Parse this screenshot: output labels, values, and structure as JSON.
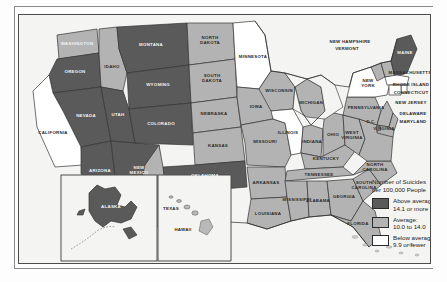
{
  "map": {
    "title": "Number of Suicides per 100,000 People",
    "projection": "united-states-choropleth",
    "colors": {
      "above_average": "#5a5a5a",
      "average": "#b3b3b3",
      "below_average": "#ffffff",
      "ocean": "#f4f4f2",
      "border": "#333333"
    },
    "legend": {
      "title_line1": "Number of Suicides",
      "title_line2": "per 100,000 People",
      "entries": [
        {
          "swatch": "#5a5a5a",
          "line1": "Above average:",
          "line2": "14.1 or more"
        },
        {
          "swatch": "#b3b3b3",
          "line1": "Average:",
          "line2": "10.0 to 14.0"
        },
        {
          "swatch": "#ffffff",
          "line1": "Below average:",
          "line2": "9.9 or fewer"
        }
      ]
    },
    "insets": [
      {
        "name": "alaska-inset",
        "label": "ALASKA"
      },
      {
        "name": "hawaii-inset",
        "label": "HAWAII"
      }
    ],
    "states": [
      {
        "label": "WASHINGTON",
        "category": "average"
      },
      {
        "label": "OREGON",
        "category": "above_average"
      },
      {
        "label": "IDAHO",
        "category": "average"
      },
      {
        "label": "MONTANA",
        "category": "above_average"
      },
      {
        "label": "WYOMING",
        "category": "above_average"
      },
      {
        "label": "NEVADA",
        "category": "above_average"
      },
      {
        "label": "UTAH",
        "category": "above_average"
      },
      {
        "label": "COLORADO",
        "category": "above_average"
      },
      {
        "label": "CALIFORNIA",
        "category": "below_average"
      },
      {
        "label": "ARIZONA",
        "category": "above_average"
      },
      {
        "label": "NEW\nMEXICO",
        "category": "above_average"
      },
      {
        "label": "NORTH\nDAKOTA",
        "category": "average"
      },
      {
        "label": "SOUTH\nDAKOTA",
        "category": "average"
      },
      {
        "label": "NEBRASKA",
        "category": "average"
      },
      {
        "label": "KANSAS",
        "category": "average"
      },
      {
        "label": "OKLAHOMA",
        "category": "above_average"
      },
      {
        "label": "TEXAS",
        "category": "average"
      },
      {
        "label": "MINNESOTA",
        "category": "below_average"
      },
      {
        "label": "IOWA",
        "category": "average"
      },
      {
        "label": "MISSOURI",
        "category": "average"
      },
      {
        "label": "ARKANSAS",
        "category": "average"
      },
      {
        "label": "LOUISIANA",
        "category": "average"
      },
      {
        "label": "WISCONSIN",
        "category": "average"
      },
      {
        "label": "ILLINOIS",
        "category": "below_average"
      },
      {
        "label": "MICHIGAN",
        "category": "average"
      },
      {
        "label": "INDIANA",
        "category": "average"
      },
      {
        "label": "OHIO",
        "category": "average"
      },
      {
        "label": "KENTUCKY",
        "category": "average"
      },
      {
        "label": "TENNESSEE",
        "category": "average"
      },
      {
        "label": "MISSISSIPPI",
        "category": "average"
      },
      {
        "label": "ALABAMA",
        "category": "average"
      },
      {
        "label": "GEORGIA",
        "category": "average"
      },
      {
        "label": "FLORIDA",
        "category": "average"
      },
      {
        "label": "SOUTH\nCAROLINA",
        "category": "average"
      },
      {
        "label": "NORTH\nCAROLINA",
        "category": "average"
      },
      {
        "label": "WEST\nVIRGINIA",
        "category": "average"
      },
      {
        "label": "VIRGINIA",
        "category": "average"
      },
      {
        "label": "D.C.",
        "category": "average"
      },
      {
        "label": "DELAWARE",
        "category": "average"
      },
      {
        "label": "MARYLAND",
        "category": "average"
      },
      {
        "label": "PENNSYLVANIA",
        "category": "average"
      },
      {
        "label": "NEW JERSEY",
        "category": "average"
      },
      {
        "label": "NEW\nYORK",
        "category": "below_average"
      },
      {
        "label": "CONNECTICUT",
        "category": "below_average"
      },
      {
        "label": "RHODE ISLAND",
        "category": "below_average"
      },
      {
        "label": "MASSACHUSETTS",
        "category": "below_average"
      },
      {
        "label": "VERMONT",
        "category": "average"
      },
      {
        "label": "NEW HAMPSHIRE",
        "category": "average"
      },
      {
        "label": "MAINE",
        "category": "above_average"
      },
      {
        "label": "ALASKA",
        "category": "above_average"
      },
      {
        "label": "HAWAII",
        "category": "below_average"
      }
    ]
  }
}
